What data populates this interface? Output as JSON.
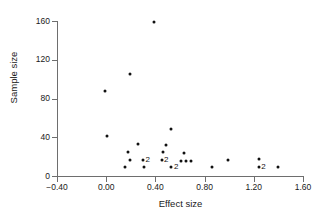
{
  "chart_data": {
    "type": "scatter",
    "title": "",
    "xlabel": "Effect size",
    "ylabel": "Sample size",
    "xlim": [
      -0.4,
      1.6
    ],
    "ylim": [
      0,
      160
    ],
    "grid": false,
    "legend": null,
    "xticks": [
      "-0.40",
      "0.00",
      "0.40",
      "0.80",
      "1.20",
      "1.60"
    ],
    "xtick_values": [
      -0.4,
      0.0,
      0.4,
      0.8,
      1.2,
      1.6
    ],
    "yticks": [
      "0",
      "40",
      "80",
      "120",
      "160"
    ],
    "ytick_values": [
      0,
      40,
      80,
      120,
      160
    ],
    "points": [
      {
        "x": 0.39,
        "y": 159,
        "count": 1,
        "label": ""
      },
      {
        "x": 0.19,
        "y": 105,
        "count": 1,
        "label": ""
      },
      {
        "x": -0.01,
        "y": 88,
        "count": 1,
        "label": ""
      },
      {
        "x": 0.53,
        "y": 49,
        "count": 1,
        "label": ""
      },
      {
        "x": 0.01,
        "y": 41,
        "count": 1,
        "label": ""
      },
      {
        "x": 0.26,
        "y": 33,
        "count": 1,
        "label": ""
      },
      {
        "x": 0.49,
        "y": 32,
        "count": 1,
        "label": ""
      },
      {
        "x": 0.18,
        "y": 25,
        "count": 1,
        "label": ""
      },
      {
        "x": 0.46,
        "y": 25,
        "count": 1,
        "label": ""
      },
      {
        "x": 0.63,
        "y": 24,
        "count": 1,
        "label": ""
      },
      {
        "x": 0.19,
        "y": 17,
        "count": 1,
        "label": ""
      },
      {
        "x": 0.3,
        "y": 17,
        "count": 2,
        "label": "2"
      },
      {
        "x": 0.45,
        "y": 17,
        "count": 2,
        "label": "2"
      },
      {
        "x": 0.61,
        "y": 16,
        "count": 1,
        "label": ""
      },
      {
        "x": 0.65,
        "y": 16,
        "count": 1,
        "label": ""
      },
      {
        "x": 0.69,
        "y": 16,
        "count": 1,
        "label": ""
      },
      {
        "x": 0.99,
        "y": 17,
        "count": 1,
        "label": ""
      },
      {
        "x": 1.24,
        "y": 18,
        "count": 1,
        "label": ""
      },
      {
        "x": 0.15,
        "y": 9,
        "count": 1,
        "label": ""
      },
      {
        "x": 0.31,
        "y": 9,
        "count": 1,
        "label": ""
      },
      {
        "x": 0.53,
        "y": 9,
        "count": 2,
        "label": "2"
      },
      {
        "x": 0.86,
        "y": 9,
        "count": 1,
        "label": ""
      },
      {
        "x": 1.24,
        "y": 9,
        "count": 2,
        "label": "2"
      },
      {
        "x": 1.4,
        "y": 9,
        "count": 1,
        "label": ""
      }
    ]
  },
  "colors": {
    "point": "#111111",
    "axis": "#6e6e6e",
    "text": "#1a1a1a",
    "background": "#ffffff"
  }
}
